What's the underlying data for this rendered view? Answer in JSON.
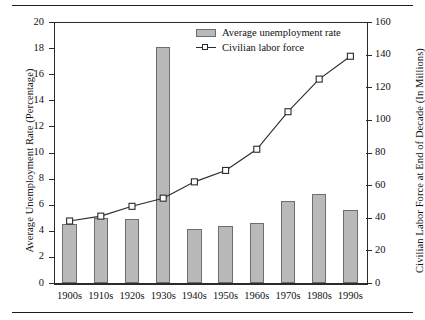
{
  "chart_data": {
    "type": "bar",
    "title": "",
    "subtitle": "",
    "xlabel": "",
    "ylabel": "Average Unemployment Rate (Percentage)",
    "y2label": "Civilian Labor Force at End of Decade (In Millions)",
    "categories": [
      "1900s",
      "1910s",
      "1920s",
      "1930s",
      "1940s",
      "1950s",
      "1960s",
      "1970s",
      "1980s",
      "1990s"
    ],
    "ylim": [
      0,
      20
    ],
    "y2lim": [
      0,
      160
    ],
    "yticks": [
      0,
      2,
      4,
      6,
      8,
      10,
      12,
      14,
      16,
      18,
      20
    ],
    "y2ticks": [
      0,
      20,
      40,
      60,
      80,
      100,
      120,
      140,
      160
    ],
    "grid": false,
    "legend_position": "top-center",
    "series": [
      {
        "name": "Average unemployment rate",
        "type": "bar",
        "axis": "left",
        "fill_color": "#b9b9b9",
        "edge_color": "#6d6d6d",
        "values": [
          4.5,
          5.0,
          4.9,
          18.1,
          4.1,
          4.4,
          4.6,
          6.3,
          6.8,
          5.6
        ]
      },
      {
        "name": "Civilian labor force",
        "type": "line",
        "axis": "right",
        "line_color": "#2a2a2a",
        "marker": "square",
        "values": [
          38,
          41,
          47,
          52,
          62,
          69,
          82,
          105,
          125,
          139
        ]
      }
    ]
  },
  "legend": {
    "items": [
      {
        "label": "Average unemployment rate",
        "marker": "bar-swatch"
      },
      {
        "label": "Civilian labor force",
        "marker": "line-square-marker"
      }
    ]
  },
  "axes": {
    "left_title": "Average Unemployment Rate (Percentage)",
    "right_title": "Civilian Labor Force at End of Decade (In Millions)",
    "left_ticklabels": [
      "0",
      "2",
      "4",
      "6",
      "8",
      "10",
      "12",
      "14",
      "16",
      "18",
      "20"
    ],
    "right_ticklabels": [
      "0",
      "20",
      "40",
      "60",
      "80",
      "100",
      "120",
      "140",
      "160"
    ],
    "x_ticklabels": [
      "1900s",
      "1910s",
      "1920s",
      "1930s",
      "1940s",
      "1950s",
      "1960s",
      "1970s",
      "1980s",
      "1990s"
    ]
  }
}
